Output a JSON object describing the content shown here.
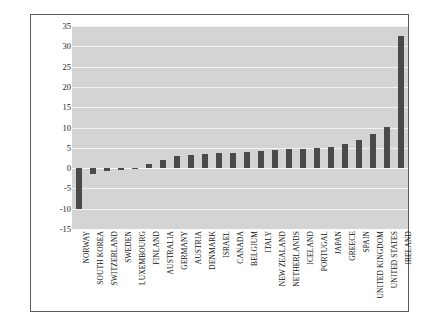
{
  "chart_data": {
    "type": "bar",
    "title": "",
    "xlabel": "",
    "ylabel": "% OF GDP",
    "ylim": [
      -15,
      35
    ],
    "yticks": [
      35,
      30,
      25,
      20,
      15,
      10,
      5,
      0,
      -5,
      -10,
      -15
    ],
    "grid": true,
    "legend": null,
    "categories": [
      "NORWAY",
      "SOUTH KOREA",
      "SWITZERLAND",
      "SWEDEN",
      "LUXEMBOURG",
      "FINLAND",
      "AUSTRALIA",
      "GERMANY",
      "AUSTRIA",
      "DENMARK",
      "ISRAEL",
      "CANADA",
      "BELGIUM",
      "ITALY",
      "NEW ZEALAND",
      "NETHERLANDS",
      "ICELAND",
      "PORTUGAL",
      "JAPAN",
      "GREECE",
      "SPAIN",
      "UNITED KINGDOM",
      "UNITED STATES",
      "IRELAND"
    ],
    "values": [
      -10.0,
      -1.5,
      -0.6,
      -0.4,
      -0.2,
      1.0,
      2.0,
      3.0,
      3.2,
      3.4,
      3.6,
      3.8,
      4.0,
      4.2,
      4.4,
      4.6,
      4.8,
      5.0,
      5.2,
      6.0,
      7.0,
      8.5,
      10.2,
      32.5
    ],
    "colors": {
      "bar": "#4a4a4a",
      "plot_background": "#d4d4d4",
      "gridline": "#f2f2f2",
      "frame": "#5a5a5a",
      "text": "#1c1c1c"
    }
  }
}
